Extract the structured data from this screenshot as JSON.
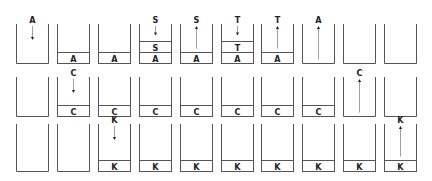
{
  "rows": [
    {
      "name": "row-1",
      "steps": [
        {
          "stack": [],
          "op": "push",
          "label": "A",
          "result": [
            "A"
          ]
        },
        {
          "stack": [
            "A"
          ],
          "op": null,
          "label": null
        },
        {
          "stack": [
            "A"
          ],
          "op": null,
          "label": null
        },
        {
          "stack": [
            "A",
            "S"
          ],
          "op": "push",
          "label": "S"
        },
        {
          "stack": [
            "A"
          ],
          "op": "pop",
          "label": "S"
        },
        {
          "stack": [
            "A",
            "T"
          ],
          "op": "push",
          "label": "T"
        },
        {
          "stack": [
            "A"
          ],
          "op": "pop",
          "label": "T"
        },
        {
          "stack": [],
          "op": "pop",
          "label": "A"
        },
        {
          "stack": [],
          "op": null,
          "label": null
        },
        {
          "stack": [],
          "op": null,
          "label": null
        }
      ]
    },
    {
      "name": "row-2",
      "steps": [
        {
          "stack": [],
          "op": null,
          "label": null
        },
        {
          "stack": [
            "C"
          ],
          "op": "push",
          "label": "C"
        },
        {
          "stack": [
            "C"
          ],
          "op": null,
          "label": null
        },
        {
          "stack": [
            "C"
          ],
          "op": null,
          "label": null
        },
        {
          "stack": [
            "C"
          ],
          "op": null,
          "label": null
        },
        {
          "stack": [
            "C"
          ],
          "op": null,
          "label": null
        },
        {
          "stack": [
            "C"
          ],
          "op": null,
          "label": null
        },
        {
          "stack": [
            "C"
          ],
          "op": null,
          "label": null
        },
        {
          "stack": [],
          "op": "pop",
          "label": "C"
        },
        {
          "stack": [],
          "op": null,
          "label": null
        }
      ]
    },
    {
      "name": "row-3",
      "steps": [
        {
          "stack": [],
          "op": null,
          "label": null
        },
        {
          "stack": [],
          "op": null,
          "label": null
        },
        {
          "stack": [
            "K"
          ],
          "op": "push",
          "label": "K"
        },
        {
          "stack": [
            "K"
          ],
          "op": null,
          "label": null
        },
        {
          "stack": [
            "K"
          ],
          "op": null,
          "label": null
        },
        {
          "stack": [
            "K"
          ],
          "op": null,
          "label": null
        },
        {
          "stack": [
            "K"
          ],
          "op": null,
          "label": null
        },
        {
          "stack": [
            "K"
          ],
          "op": null,
          "label": null
        },
        {
          "stack": [
            "K"
          ],
          "op": null,
          "label": null
        },
        {
          "stack": [
            "K"
          ],
          "op": "pop",
          "label": "K"
        }
      ]
    }
  ],
  "colors": {
    "line": "#555555",
    "text": "#222222",
    "arrow": "#888888",
    "background": "#ffffff"
  }
}
